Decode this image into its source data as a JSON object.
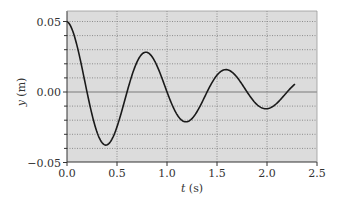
{
  "chart_data": {
    "type": "line",
    "title": "",
    "xlabel_var": "t",
    "xlabel_unit": " (s)",
    "ylabel_var": "y",
    "ylabel_unit": " (m)",
    "xlim": [
      0.0,
      2.5
    ],
    "ylim": [
      -0.05,
      0.06
    ],
    "x_ticks": [
      "0.0",
      "0.5",
      "1.0",
      "1.5",
      "2.0",
      "2.5"
    ],
    "y_ticks": [
      "0.05",
      "0.00",
      "−0.05"
    ],
    "grid": true,
    "legend": null,
    "series": [
      {
        "name": "y(t)",
        "description": "damped oscillation, y ≈ 0.05·e^(−0.72t)·cos(7.85t)",
        "x": [
          0.0,
          0.1,
          0.2,
          0.3,
          0.4,
          0.5,
          0.6,
          0.7,
          0.8,
          0.9,
          1.0,
          1.1,
          1.2,
          1.3,
          1.4,
          1.5,
          1.6,
          1.7,
          1.8,
          1.9,
          2.0,
          2.1,
          2.2,
          2.28
        ],
        "y": [
          0.05,
          0.0331,
          0.0006,
          -0.0281,
          -0.0374,
          -0.0255,
          -0.0004,
          0.0211,
          0.028,
          0.0192,
          0.0003,
          -0.0159,
          -0.021,
          -0.0144,
          -0.0002,
          0.0119,
          0.0158,
          0.0108,
          0.0002,
          -0.0089,
          -0.0118,
          -0.0081,
          -0.0001,
          0.0051
        ]
      }
    ],
    "extrema": [
      {
        "t": 0.0,
        "y": 0.05
      },
      {
        "t": 0.4,
        "y": -0.037
      },
      {
        "t": 0.8,
        "y": 0.028
      },
      {
        "t": 1.2,
        "y": -0.021
      },
      {
        "t": 1.6,
        "y": 0.016
      },
      {
        "t": 2.0,
        "y": -0.012
      }
    ]
  },
  "style": {
    "plot_bg": "#dcdcdc",
    "grid_color": "#8c8c8c",
    "zero_line_color": "#7a7a7a",
    "curve_color": "#1a1a1a",
    "axis_color": "#333333"
  }
}
